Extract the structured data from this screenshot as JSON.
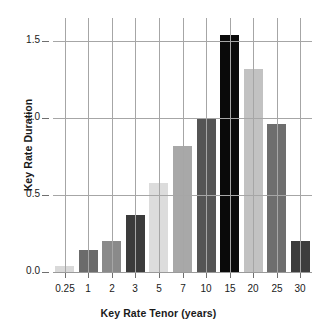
{
  "chart_data": {
    "type": "bar",
    "title": "",
    "xlabel": "Key Rate Tenor (years)",
    "ylabel": "Key Rate Duration",
    "categories": [
      "0.25",
      "1",
      "2",
      "3",
      "5",
      "7",
      "10",
      "15",
      "20",
      "25",
      "30"
    ],
    "values": [
      0.04,
      0.14,
      0.2,
      0.37,
      0.58,
      0.82,
      1.0,
      1.54,
      1.32,
      0.96,
      0.2
    ],
    "bar_colors": [
      "#d9d9d9",
      "#6b6b6b",
      "#8a8a8a",
      "#3b3b3b",
      "#dcdcdc",
      "#a8a8a8",
      "#555555",
      "#0a0a0a",
      "#c2c2c2",
      "#6e6e6e",
      "#3d3d3d"
    ],
    "ylim": [
      0.0,
      1.65
    ],
    "yticks": [
      "0.0",
      "0.5",
      "1.0",
      "1.5"
    ],
    "ytick_values": [
      0.0,
      0.5,
      1.0,
      1.5
    ],
    "grid": "vertical-and-horizontal",
    "legend": "none",
    "axis_color": "#a6a6a6",
    "text_color": "#1a1a1a"
  }
}
